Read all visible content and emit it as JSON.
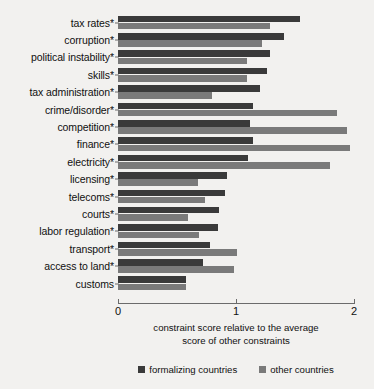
{
  "chart_data": {
    "type": "bar",
    "orientation": "horizontal",
    "title": "",
    "subtitle": "",
    "xlabel": "constraint score relative to the average score of other constraints",
    "xlabel_lines": [
      "constraint score relative to the average",
      "score of other constraints"
    ],
    "ylabel": "",
    "xlim": [
      0,
      2
    ],
    "xticks": [
      0,
      1,
      2
    ],
    "xticklabels": [
      "0",
      "1",
      "2"
    ],
    "grid": false,
    "legend_position": "bottom-center",
    "categories": [
      "tax rates*",
      "corruption*",
      "political instability*",
      "skills*",
      "tax administration*",
      "crime/disorder*",
      "competition*",
      "finance*",
      "electricity*",
      "licensing*",
      "telecoms*",
      "courts*",
      "labor regulation*",
      "transport*",
      "access to land*",
      "customs"
    ],
    "series": [
      {
        "name": "formalizing countries",
        "color": "#3a3a3a",
        "values": [
          1.54,
          1.41,
          1.29,
          1.26,
          1.2,
          1.14,
          1.12,
          1.14,
          1.1,
          0.92,
          0.91,
          0.86,
          0.85,
          0.78,
          0.72,
          0.58
        ]
      },
      {
        "name": "other countries",
        "color": "#7a7a7a",
        "values": [
          1.29,
          1.22,
          1.09,
          1.09,
          0.8,
          1.86,
          1.94,
          1.97,
          1.8,
          0.68,
          0.74,
          0.59,
          0.69,
          1.01,
          0.98,
          0.58
        ]
      }
    ]
  },
  "legend": {
    "items": [
      {
        "label": "formalizing countries",
        "color": "#3a3a3a",
        "swatch_name": "legend-swatch-formalizing-countries"
      },
      {
        "label": "other countries",
        "color": "#7a7a7a",
        "swatch_name": "legend-swatch-other-countries"
      }
    ]
  },
  "colors": {
    "background": "#f2f1ef",
    "axis": "#6b6b6b",
    "text": "#101010",
    "series_formalizing": "#3a3a3a",
    "series_other": "#7a7a7a"
  }
}
